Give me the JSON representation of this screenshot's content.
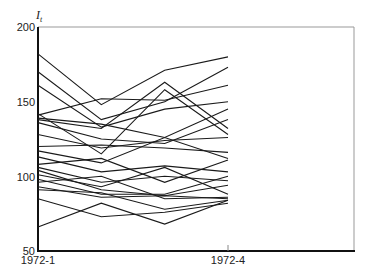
{
  "chart_data": {
    "type": "line",
    "title": "",
    "ylabel": "I_t",
    "xlabel": "",
    "ylim": [
      50,
      200
    ],
    "yticks": [
      50,
      100,
      150,
      200
    ],
    "x": [
      "1972-1",
      "1972-2",
      "1972-3",
      "1972-4"
    ],
    "xtick_labels": [
      "1972-1",
      "1972-4"
    ],
    "grid": false,
    "legend": null,
    "series": [
      {
        "name": "s1",
        "values": [
          182,
          148,
          171,
          180
        ]
      },
      {
        "name": "s2",
        "values": [
          170,
          138,
          150,
          173
        ]
      },
      {
        "name": "s3",
        "values": [
          161,
          133,
          145,
          150
        ]
      },
      {
        "name": "s4",
        "values": [
          141,
          152,
          151,
          161
        ]
      },
      {
        "name": "s5",
        "values": [
          142,
          115,
          158,
          128
        ]
      },
      {
        "name": "s6",
        "values": [
          139,
          135,
          126,
          145
        ]
      },
      {
        "name": "s7",
        "values": [
          138,
          132,
          163,
          132
        ]
      },
      {
        "name": "s8",
        "values": [
          136,
          125,
          122,
          138
        ]
      },
      {
        "name": "s9",
        "values": [
          128,
          119,
          124,
          126
        ]
      },
      {
        "name": "s10",
        "values": [
          120,
          121,
          119,
          116
        ]
      },
      {
        "name": "s11",
        "values": [
          117,
          109,
          126,
          112
        ]
      },
      {
        "name": "s12",
        "values": [
          113,
          103,
          107,
          103
        ]
      },
      {
        "name": "s13",
        "values": [
          108,
          112,
          96,
          111
        ]
      },
      {
        "name": "s14",
        "values": [
          106,
          96,
          100,
          97
        ]
      },
      {
        "name": "s15",
        "values": [
          104,
          91,
          87,
          94
        ]
      },
      {
        "name": "s16",
        "values": [
          101,
          93,
          106,
          88
        ]
      },
      {
        "name": "s17",
        "values": [
          98,
          88,
          88,
          100
        ]
      },
      {
        "name": "s18",
        "values": [
          96,
          100,
          85,
          86
        ]
      },
      {
        "name": "s19",
        "values": [
          93,
          86,
          87,
          85
        ]
      },
      {
        "name": "s20",
        "values": [
          91,
          89,
          78,
          84
        ]
      },
      {
        "name": "s21",
        "values": [
          85,
          73,
          76,
          82
        ]
      },
      {
        "name": "s22",
        "values": [
          66,
          82,
          68,
          84
        ]
      }
    ]
  },
  "axes": {
    "y_title": "I",
    "y_title_sub": "t",
    "y_tick_labels": [
      "200",
      "150",
      "100",
      "50"
    ],
    "x_tick_labels": [
      "1972-1",
      "1972-4"
    ]
  }
}
